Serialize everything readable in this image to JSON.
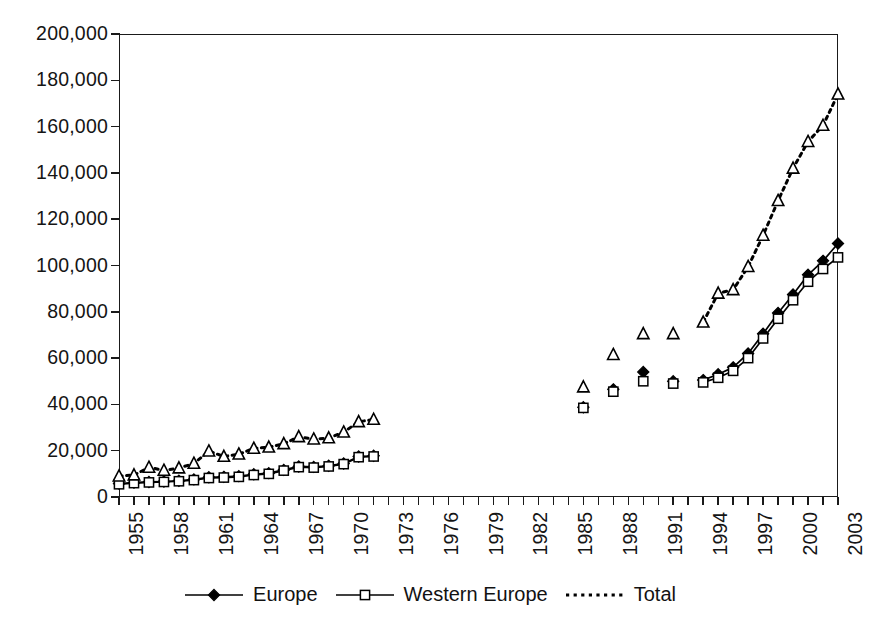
{
  "chart_data": {
    "type": "line",
    "title": "",
    "xlabel": "",
    "ylabel": "",
    "ylim": [
      0,
      200000
    ],
    "xlim": [
      1955,
      2003
    ],
    "grid": false,
    "legend_position": "bottom-center",
    "ytick_labels": [
      "200,000",
      "180,000",
      "160,000",
      "140,000",
      "120,000",
      "100,000",
      "80,000",
      "60,000",
      "40,000",
      "20,000",
      "0"
    ],
    "ytick_values": [
      200000,
      180000,
      160000,
      140000,
      120000,
      100000,
      80000,
      60000,
      40000,
      20000,
      0
    ],
    "xtick_labels": [
      "1955",
      "1958",
      "1961",
      "1964",
      "1967",
      "1970",
      "1973",
      "1976",
      "1979",
      "1982",
      "1985",
      "1988",
      "1991",
      "1994",
      "1997",
      "2000",
      "2003"
    ],
    "xtick_values": [
      1955,
      1958,
      1961,
      1964,
      1967,
      1970,
      1973,
      1976,
      1979,
      1982,
      1985,
      1988,
      1991,
      1994,
      1997,
      2000,
      2003
    ],
    "x": [
      1955,
      1956,
      1957,
      1958,
      1959,
      1960,
      1961,
      1962,
      1963,
      1964,
      1965,
      1966,
      1967,
      1968,
      1969,
      1970,
      1971,
      1972,
      1986,
      1988,
      1990,
      1992,
      1994,
      1995,
      1996,
      1997,
      1998,
      1999,
      2000,
      2001,
      2002,
      2003
    ],
    "series": [
      {
        "name": "Europe",
        "marker": "filled-diamond",
        "line": "solid",
        "color": "#000000",
        "x": [
          1955,
          1956,
          1957,
          1958,
          1959,
          1960,
          1961,
          1962,
          1963,
          1964,
          1965,
          1966,
          1967,
          1968,
          1969,
          1970,
          1971,
          1972,
          1986,
          1988,
          1990,
          1992,
          1994,
          1995,
          1996,
          1997,
          1998,
          1999,
          2000,
          2001,
          2002,
          2003
        ],
        "values": [
          5800,
          6200,
          6500,
          6700,
          7000,
          7600,
          8500,
          8700,
          9000,
          9800,
          10300,
          11700,
          13200,
          13000,
          13500,
          14500,
          17500,
          17800,
          38800,
          46500,
          54000,
          50000,
          50500,
          53000,
          56000,
          62000,
          70500,
          79500,
          87500,
          96000,
          102000,
          109500
        ],
        "segments": [
          {
            "from": 1955,
            "to": 1972,
            "connected": true
          },
          {
            "from": 1986,
            "to": 1992,
            "connected": false
          },
          {
            "from": 1994,
            "to": 2003,
            "connected": true
          }
        ]
      },
      {
        "name": "Western Europe",
        "marker": "open-square",
        "line": "solid",
        "color": "#000000",
        "x": [
          1955,
          1956,
          1957,
          1958,
          1959,
          1960,
          1961,
          1962,
          1963,
          1964,
          1965,
          1966,
          1967,
          1968,
          1969,
          1970,
          1971,
          1972,
          1986,
          1988,
          1990,
          1992,
          1994,
          1995,
          1996,
          1997,
          1998,
          1999,
          2000,
          2001,
          2002,
          2003
        ],
        "values": [
          5500,
          6000,
          6300,
          6500,
          6800,
          7300,
          8200,
          8400,
          8700,
          9500,
          10000,
          11400,
          12900,
          12700,
          13200,
          14200,
          17200,
          17500,
          38500,
          45500,
          50000,
          49000,
          49500,
          51500,
          54500,
          60000,
          68500,
          77000,
          85000,
          93000,
          98500,
          103500
        ],
        "segments": [
          {
            "from": 1955,
            "to": 1972,
            "connected": true
          },
          {
            "from": 1986,
            "to": 1992,
            "connected": false
          },
          {
            "from": 1994,
            "to": 2003,
            "connected": true
          }
        ]
      },
      {
        "name": "Total",
        "marker": "open-triangle",
        "line": "dotted",
        "color": "#000000",
        "x": [
          1955,
          1956,
          1957,
          1958,
          1959,
          1960,
          1961,
          1962,
          1963,
          1964,
          1965,
          1966,
          1967,
          1968,
          1969,
          1970,
          1971,
          1972,
          1986,
          1988,
          1990,
          1992,
          1994,
          1995,
          1996,
          1997,
          1998,
          1999,
          2000,
          2001,
          2002,
          2003
        ],
        "values": [
          9000,
          9500,
          12800,
          11500,
          12500,
          14500,
          19800,
          17500,
          18500,
          21000,
          21500,
          23000,
          26000,
          25000,
          25500,
          28000,
          32500,
          33500,
          47500,
          61500,
          70500,
          70500,
          75500,
          88000,
          89500,
          99500,
          113000,
          128000,
          142000,
          153500,
          160500,
          174000
        ],
        "segments": [
          {
            "from": 1955,
            "to": 1972,
            "connected": true
          },
          {
            "from": 1986,
            "to": 1992,
            "connected": false
          },
          {
            "from": 1994,
            "to": 2003,
            "connected": true
          }
        ]
      }
    ]
  },
  "legend": {
    "items": [
      {
        "label": "Europe",
        "marker": "filled-diamond",
        "line": "solid"
      },
      {
        "label": "Western Europe",
        "marker": "open-square",
        "line": "solid"
      },
      {
        "label": "Total",
        "marker": "none",
        "line": "dotted"
      }
    ]
  }
}
